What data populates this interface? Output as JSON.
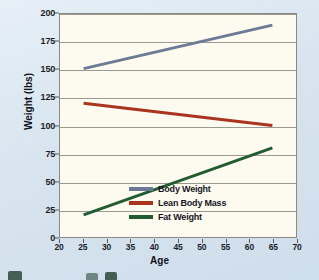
{
  "chart_data": {
    "type": "line",
    "title": "",
    "xlabel": "Age",
    "ylabel": "Weight (lbs)",
    "xlim": [
      20,
      70
    ],
    "ylim": [
      0,
      200
    ],
    "xticks": [
      20,
      25,
      30,
      35,
      40,
      45,
      50,
      55,
      60,
      65,
      70
    ],
    "yticks": [
      0,
      25,
      50,
      75,
      100,
      125,
      150,
      175,
      200
    ],
    "grid": "horizontal",
    "legend_position": "inside-lower-right",
    "series": [
      {
        "name": "Body Weight",
        "color": "#6d7a96",
        "x": [
          25,
          65
        ],
        "values": [
          151,
          190
        ]
      },
      {
        "name": "Lean Body Mass",
        "color": "#a9351f",
        "x": [
          25,
          65
        ],
        "values": [
          120,
          100
        ]
      },
      {
        "name": "Fat Weight",
        "color": "#225c30",
        "x": [
          25,
          65
        ],
        "values": [
          20,
          80
        ]
      }
    ]
  },
  "figure": {
    "background_color": "#dde8f1",
    "plot_background_color": "#fdfbf0",
    "plot_border_color": "#8a8a82",
    "gridline_color": "#9a9a90"
  }
}
